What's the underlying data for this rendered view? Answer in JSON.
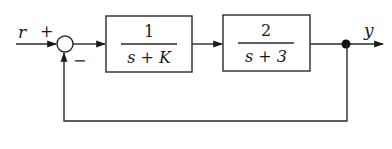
{
  "diagram": {
    "type": "feedback-control-block-diagram",
    "input_label": "r",
    "output_label": "y",
    "summing_junction": {
      "plus_sign": "+",
      "minus_sign": "−"
    },
    "blocks": [
      {
        "numerator": "1",
        "denominator": "s + K"
      },
      {
        "numerator": "2",
        "denominator": "s + 3"
      }
    ],
    "feedback": "unity negative feedback",
    "colors": {
      "stroke": "#2a2a2a",
      "background": "#ffffff"
    }
  }
}
